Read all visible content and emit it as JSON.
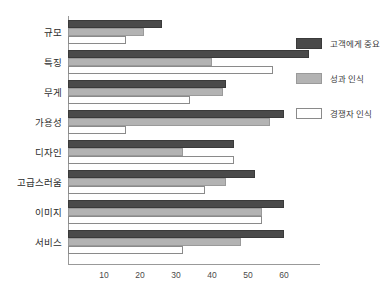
{
  "chart_data": {
    "type": "bar",
    "orientation": "horizontal",
    "title": "",
    "xlabel": "",
    "ylabel": "",
    "xlim": [
      0,
      70
    ],
    "grid": false,
    "legend_position": "right",
    "xticks": [
      "10",
      "20",
      "30",
      "40",
      "50",
      "60"
    ],
    "xtick_values": [
      10,
      20,
      30,
      40,
      50,
      60
    ],
    "categories": [
      "규모",
      "특징",
      "무게",
      "가용성",
      "디자인",
      "고급스러움",
      "이미지",
      "서비스"
    ],
    "series": [
      {
        "name": "고객에게 중요",
        "color": "#4a4a4a",
        "values": [
          26,
          67,
          44,
          60,
          46,
          52,
          60,
          60
        ]
      },
      {
        "name": "성과 인식",
        "color": "#b3b3b3",
        "values": [
          21,
          40,
          43,
          56,
          32,
          44,
          54,
          48
        ]
      },
      {
        "name": "경쟁자 인식",
        "color": "#ffffff",
        "values": [
          16,
          57,
          34,
          16,
          46,
          38,
          54,
          32
        ]
      }
    ]
  }
}
